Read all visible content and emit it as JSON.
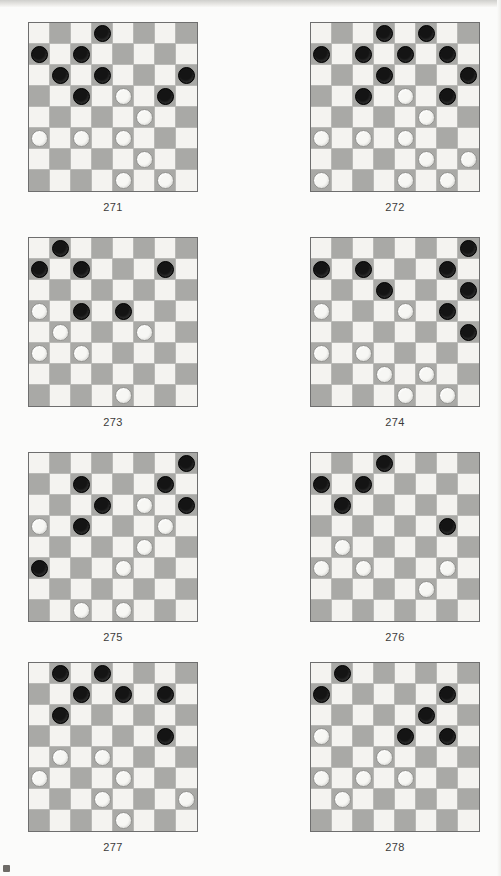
{
  "page": {
    "kind": "checkers-puzzle-worksheet",
    "columns": 2,
    "rows": 4,
    "board_size": 8,
    "colors": {
      "light_square": "#f4f3f0",
      "dark_square": "#a9a9a6",
      "black_piece": "#141414",
      "white_piece": "#f7f7f4",
      "board_border": "#6e6e6e",
      "grid_line": "#b9b9b6",
      "caption_text": "#3b3b3b",
      "page_background": "#fbfbfa"
    }
  },
  "puzzles": [
    {
      "number": "271",
      "x": 28,
      "y": 22,
      "pieces": [
        {
          "row": 0,
          "col": 3,
          "color": "black"
        },
        {
          "row": 1,
          "col": 0,
          "color": "black"
        },
        {
          "row": 1,
          "col": 2,
          "color": "black"
        },
        {
          "row": 2,
          "col": 1,
          "color": "black"
        },
        {
          "row": 2,
          "col": 3,
          "color": "black"
        },
        {
          "row": 2,
          "col": 7,
          "color": "black"
        },
        {
          "row": 3,
          "col": 2,
          "color": "black"
        },
        {
          "row": 3,
          "col": 4,
          "color": "white"
        },
        {
          "row": 3,
          "col": 6,
          "color": "black"
        },
        {
          "row": 4,
          "col": 5,
          "color": "white"
        },
        {
          "row": 5,
          "col": 0,
          "color": "white"
        },
        {
          "row": 5,
          "col": 2,
          "color": "white"
        },
        {
          "row": 5,
          "col": 4,
          "color": "white"
        },
        {
          "row": 6,
          "col": 5,
          "color": "white"
        },
        {
          "row": 7,
          "col": 4,
          "color": "white"
        },
        {
          "row": 7,
          "col": 6,
          "color": "white"
        }
      ]
    },
    {
      "number": "272",
      "x": 310,
      "y": 22,
      "pieces": [
        {
          "row": 0,
          "col": 3,
          "color": "black"
        },
        {
          "row": 0,
          "col": 5,
          "color": "black"
        },
        {
          "row": 1,
          "col": 0,
          "color": "black"
        },
        {
          "row": 1,
          "col": 2,
          "color": "black"
        },
        {
          "row": 1,
          "col": 4,
          "color": "black"
        },
        {
          "row": 1,
          "col": 6,
          "color": "black"
        },
        {
          "row": 2,
          "col": 3,
          "color": "black"
        },
        {
          "row": 2,
          "col": 7,
          "color": "black"
        },
        {
          "row": 3,
          "col": 2,
          "color": "black"
        },
        {
          "row": 3,
          "col": 4,
          "color": "white"
        },
        {
          "row": 3,
          "col": 6,
          "color": "black"
        },
        {
          "row": 4,
          "col": 5,
          "color": "white"
        },
        {
          "row": 5,
          "col": 0,
          "color": "white"
        },
        {
          "row": 5,
          "col": 2,
          "color": "white"
        },
        {
          "row": 5,
          "col": 4,
          "color": "white"
        },
        {
          "row": 6,
          "col": 5,
          "color": "white"
        },
        {
          "row": 6,
          "col": 7,
          "color": "white"
        },
        {
          "row": 7,
          "col": 0,
          "color": "white"
        },
        {
          "row": 7,
          "col": 4,
          "color": "white"
        },
        {
          "row": 7,
          "col": 6,
          "color": "white"
        }
      ]
    },
    {
      "number": "273",
      "x": 28,
      "y": 237,
      "pieces": [
        {
          "row": 0,
          "col": 1,
          "color": "black"
        },
        {
          "row": 1,
          "col": 0,
          "color": "black"
        },
        {
          "row": 1,
          "col": 2,
          "color": "black"
        },
        {
          "row": 1,
          "col": 6,
          "color": "black"
        },
        {
          "row": 3,
          "col": 0,
          "color": "white"
        },
        {
          "row": 3,
          "col": 2,
          "color": "black"
        },
        {
          "row": 3,
          "col": 4,
          "color": "black"
        },
        {
          "row": 4,
          "col": 1,
          "color": "white"
        },
        {
          "row": 4,
          "col": 5,
          "color": "white"
        },
        {
          "row": 5,
          "col": 0,
          "color": "white"
        },
        {
          "row": 5,
          "col": 2,
          "color": "white"
        },
        {
          "row": 7,
          "col": 4,
          "color": "white"
        }
      ]
    },
    {
      "number": "274",
      "x": 310,
      "y": 237,
      "pieces": [
        {
          "row": 0,
          "col": 7,
          "color": "black"
        },
        {
          "row": 1,
          "col": 0,
          "color": "black"
        },
        {
          "row": 1,
          "col": 2,
          "color": "black"
        },
        {
          "row": 1,
          "col": 6,
          "color": "black"
        },
        {
          "row": 2,
          "col": 3,
          "color": "black"
        },
        {
          "row": 2,
          "col": 7,
          "color": "black"
        },
        {
          "row": 3,
          "col": 0,
          "color": "white"
        },
        {
          "row": 3,
          "col": 4,
          "color": "white"
        },
        {
          "row": 3,
          "col": 6,
          "color": "black"
        },
        {
          "row": 4,
          "col": 7,
          "color": "black"
        },
        {
          "row": 5,
          "col": 0,
          "color": "white"
        },
        {
          "row": 5,
          "col": 2,
          "color": "white"
        },
        {
          "row": 6,
          "col": 3,
          "color": "white"
        },
        {
          "row": 6,
          "col": 5,
          "color": "white"
        },
        {
          "row": 7,
          "col": 4,
          "color": "white"
        },
        {
          "row": 7,
          "col": 6,
          "color": "white"
        }
      ]
    },
    {
      "number": "275",
      "x": 28,
      "y": 452,
      "pieces": [
        {
          "row": 0,
          "col": 7,
          "color": "black"
        },
        {
          "row": 1,
          "col": 2,
          "color": "black"
        },
        {
          "row": 1,
          "col": 6,
          "color": "black"
        },
        {
          "row": 2,
          "col": 3,
          "color": "black"
        },
        {
          "row": 2,
          "col": 5,
          "color": "white"
        },
        {
          "row": 2,
          "col": 7,
          "color": "black"
        },
        {
          "row": 3,
          "col": 0,
          "color": "white"
        },
        {
          "row": 3,
          "col": 2,
          "color": "black"
        },
        {
          "row": 3,
          "col": 6,
          "color": "white"
        },
        {
          "row": 4,
          "col": 5,
          "color": "white"
        },
        {
          "row": 5,
          "col": 0,
          "color": "black"
        },
        {
          "row": 5,
          "col": 4,
          "color": "white"
        },
        {
          "row": 7,
          "col": 2,
          "color": "white"
        },
        {
          "row": 7,
          "col": 4,
          "color": "white"
        }
      ]
    },
    {
      "number": "276",
      "x": 310,
      "y": 452,
      "pieces": [
        {
          "row": 0,
          "col": 3,
          "color": "black"
        },
        {
          "row": 1,
          "col": 0,
          "color": "black"
        },
        {
          "row": 1,
          "col": 2,
          "color": "black"
        },
        {
          "row": 2,
          "col": 1,
          "color": "black"
        },
        {
          "row": 3,
          "col": 6,
          "color": "black"
        },
        {
          "row": 4,
          "col": 1,
          "color": "white"
        },
        {
          "row": 5,
          "col": 0,
          "color": "white"
        },
        {
          "row": 5,
          "col": 2,
          "color": "white"
        },
        {
          "row": 5,
          "col": 6,
          "color": "white"
        },
        {
          "row": 6,
          "col": 5,
          "color": "white"
        }
      ]
    },
    {
      "number": "277",
      "x": 28,
      "y": 662,
      "pieces": [
        {
          "row": 0,
          "col": 1,
          "color": "black"
        },
        {
          "row": 0,
          "col": 3,
          "color": "black"
        },
        {
          "row": 1,
          "col": 2,
          "color": "black"
        },
        {
          "row": 1,
          "col": 4,
          "color": "black"
        },
        {
          "row": 1,
          "col": 6,
          "color": "black"
        },
        {
          "row": 2,
          "col": 1,
          "color": "black"
        },
        {
          "row": 3,
          "col": 6,
          "color": "black"
        },
        {
          "row": 4,
          "col": 1,
          "color": "white"
        },
        {
          "row": 4,
          "col": 3,
          "color": "white"
        },
        {
          "row": 5,
          "col": 0,
          "color": "white"
        },
        {
          "row": 5,
          "col": 4,
          "color": "white"
        },
        {
          "row": 6,
          "col": 3,
          "color": "white"
        },
        {
          "row": 6,
          "col": 7,
          "color": "white"
        },
        {
          "row": 7,
          "col": 4,
          "color": "white"
        }
      ]
    },
    {
      "number": "278",
      "x": 310,
      "y": 662,
      "pieces": [
        {
          "row": 0,
          "col": 1,
          "color": "black"
        },
        {
          "row": 1,
          "col": 0,
          "color": "black"
        },
        {
          "row": 1,
          "col": 6,
          "color": "black"
        },
        {
          "row": 2,
          "col": 5,
          "color": "black"
        },
        {
          "row": 3,
          "col": 0,
          "color": "white"
        },
        {
          "row": 3,
          "col": 4,
          "color": "black"
        },
        {
          "row": 3,
          "col": 6,
          "color": "black"
        },
        {
          "row": 4,
          "col": 3,
          "color": "white"
        },
        {
          "row": 5,
          "col": 0,
          "color": "white"
        },
        {
          "row": 5,
          "col": 2,
          "color": "white"
        },
        {
          "row": 5,
          "col": 4,
          "color": "white"
        },
        {
          "row": 6,
          "col": 1,
          "color": "white"
        }
      ]
    }
  ]
}
